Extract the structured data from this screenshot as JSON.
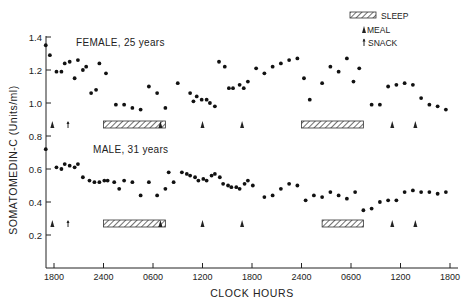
{
  "chart_data": {
    "type": "scatter",
    "title": "",
    "xlabel": "CLOCK HOURS",
    "ylabel": "SOMATOMEDIN-C (Units/ml)",
    "ylim": [
      0,
      1.4
    ],
    "x_tick_labels": [
      "1800",
      "2400",
      "0600",
      "1200",
      "1800",
      "2400",
      "0600",
      "1200",
      "1800"
    ],
    "x_tick_hours": [
      0,
      6,
      12,
      18,
      24,
      30,
      36,
      42,
      48
    ],
    "y_ticks": [
      0.2,
      0.4,
      0.6,
      0.8,
      1.0,
      1.2,
      1.4
    ],
    "y_tick_labels": [
      "0.2",
      "0.4",
      "0.6",
      "0.8",
      "1.0",
      "1.2",
      "1.4"
    ],
    "grid": false,
    "legend": {
      "position": "top-right",
      "entries": [
        {
          "symbol": "hatched-bar",
          "label": "SLEEP"
        },
        {
          "symbol": "triangle",
          "label": "MEAL"
        },
        {
          "symbol": "arrow",
          "label": "SNACK"
        }
      ]
    },
    "series": [
      {
        "name": "FEMALE, 25 years",
        "x_hours": [
          -1,
          -0.5,
          0.3,
          0.9,
          1.3,
          1.9,
          2.5,
          2.9,
          3.5,
          3.9,
          4.5,
          5.1,
          5.5,
          6.3,
          7.5,
          8.5,
          9.5,
          10.5,
          11.5,
          12.5,
          13.5,
          15,
          16.5,
          16.9,
          17.3,
          17.9,
          18.5,
          18.9,
          19.5,
          20,
          20.7,
          21.2,
          21.7,
          22.5,
          23,
          23.5,
          24.5,
          25.5,
          26.5,
          27.5,
          28.5,
          29.5,
          30.3,
          31,
          32.5,
          33.5,
          34.5,
          35.5,
          36.3,
          37,
          38.5,
          39.5,
          40.5,
          41.5,
          42.5,
          43.5,
          44.5,
          45.5,
          46.5,
          47.5
        ],
        "values": [
          1.35,
          1.29,
          1.19,
          1.19,
          1.24,
          1.25,
          1.15,
          1.26,
          1.2,
          1.22,
          1.06,
          1.08,
          1.24,
          1.18,
          0.99,
          0.99,
          0.97,
          0.96,
          1.1,
          1.06,
          0.97,
          1.12,
          1.06,
          1.01,
          1.04,
          1.02,
          1.02,
          1.0,
          0.98,
          1.25,
          1.22,
          1.09,
          1.09,
          1.11,
          1.09,
          1.13,
          1.21,
          1.18,
          1.22,
          1.24,
          1.26,
          1.27,
          1.15,
          1.02,
          1.12,
          1.22,
          1.19,
          1.27,
          1.13,
          1.21,
          0.99,
          0.99,
          1.1,
          1.11,
          1.12,
          1.11,
          1.03,
          0.99,
          0.98,
          0.96,
          0.99,
          1.06,
          1.21,
          1.03,
          1.02,
          1.11,
          1.04,
          1.11
        ],
        "meals_hours": [
          -0.2,
          12.9,
          18,
          22.8,
          41,
          43.8
        ],
        "snacks_hours": [
          1.7
        ],
        "sleep_hours": [
          6,
          13
        ]
      },
      {
        "name": "MALE, 31 years",
        "x_hours": [
          -1,
          0.3,
          0.9,
          1.3,
          1.9,
          2.5,
          2.9,
          3.5,
          4.3,
          4.9,
          5.5,
          6.1,
          6.5,
          7.3,
          7.9,
          8.5,
          9.5,
          10.5,
          11.5,
          12.5,
          13.5,
          13.9,
          14.5,
          15.5,
          16.1,
          16.5,
          17.1,
          17.5,
          18.1,
          18.5,
          19.1,
          19.5,
          20.1,
          20.5,
          21.1,
          21.5,
          22.1,
          22.5,
          23.1,
          23.5,
          24.1,
          25.5,
          26.5,
          27.5,
          28.5,
          29.5,
          30.5,
          31.5,
          32.5,
          33.5,
          34.5,
          35.5,
          36.5,
          37.5,
          38.5,
          39.5,
          40.5,
          41.5,
          42.5,
          43.5,
          44.5,
          45.5,
          46.5,
          47.5
        ],
        "values": [
          0.72,
          0.61,
          0.6,
          0.63,
          0.62,
          0.61,
          0.63,
          0.55,
          0.53,
          0.52,
          0.52,
          0.53,
          0.53,
          0.52,
          0.48,
          0.53,
          0.52,
          0.44,
          0.52,
          0.44,
          0.48,
          0.58,
          0.52,
          0.58,
          0.57,
          0.56,
          0.55,
          0.53,
          0.54,
          0.53,
          0.56,
          0.57,
          0.55,
          0.51,
          0.5,
          0.49,
          0.49,
          0.48,
          0.51,
          0.53,
          0.5,
          0.43,
          0.44,
          0.48,
          0.51,
          0.5,
          0.41,
          0.44,
          0.43,
          0.46,
          0.44,
          0.42,
          0.46,
          0.35,
          0.36,
          0.4,
          0.41,
          0.41,
          0.46,
          0.47,
          0.46,
          0.46,
          0.45,
          0.46
        ],
        "meals_hours": [
          -0.2,
          12.9,
          18,
          22.8,
          41,
          43.8
        ],
        "snacks_hours": [
          1.7
        ],
        "sleep_hours": [
          6,
          13
        ]
      }
    ],
    "annotations": [
      "FEMALE, 25 years",
      "MALE, 31 years"
    ]
  },
  "legend_text": {
    "sleep": "SLEEP",
    "meal": "MEAL",
    "snack": "SNACK"
  },
  "series_labels": {
    "female": "FEMALE, 25 years",
    "male": "MALE, 31 years"
  },
  "axis_text": {
    "x": "CLOCK HOURS",
    "y": "SOMATOMEDIN-C (Units/ml)"
  }
}
